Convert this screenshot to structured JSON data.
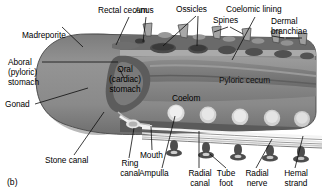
{
  "figure": {
    "panel_label": "(b)",
    "type": "grayscale-anatomical-micrograph",
    "palette": {
      "background": "#ffffff",
      "body_mid_gray": "#8e8e8e",
      "body_dark_gray": "#5f5f5f",
      "body_light_gray": "#c2c2c2",
      "highlight_white": "#e8e8e8",
      "outline": "#3a3a3a",
      "leader_line": "#0d0d0d",
      "text": "#000000"
    }
  },
  "labels": {
    "madreporite": "Madreporite",
    "rectal_cecum": "Rectal cecum",
    "anus": "Anus",
    "ossicles": "Ossicles",
    "spines": "Spines",
    "coelomic_lining": "Coelomic lining",
    "dermal_branchiae_l1": "Dermal",
    "dermal_branchiae_l2": "branchiae",
    "aboral_stomach_l1": "Aboral",
    "aboral_stomach_l2": "(pyloric)",
    "aboral_stomach_l3": "stomach",
    "oral_stomach_l1": "Oral",
    "oral_stomach_l2": "(cardiac)",
    "oral_stomach_l3": "stomach",
    "pyloric_cecum": "Pyloric cecum",
    "coelom": "Coelom",
    "gonad": "Gonad",
    "stone_canal": "Stone canal",
    "ring_canal_l1": "Ring",
    "ring_canal_l2": "canal",
    "mouth": "Mouth",
    "ampulla": "Ampulla",
    "radial_canal_l1": "Radial",
    "radial_canal_l2": "canal",
    "tube_foot_l1": "Tube",
    "tube_foot_l2": "foot",
    "radial_nerve_l1": "Radial",
    "radial_nerve_l2": "nerve",
    "hemal_strand_l1": "Hemal",
    "hemal_strand_l2": "strand"
  }
}
